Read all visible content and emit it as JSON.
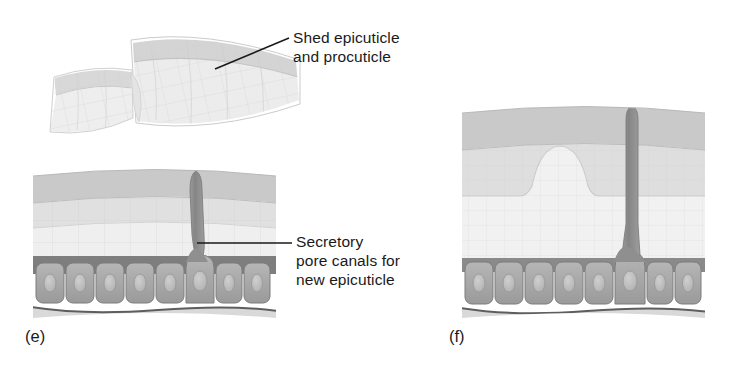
{
  "figure": {
    "background_color": "#ffffff",
    "text_color": "#1a1a1a",
    "leader_line_color": "#1a1a1a",
    "callouts": {
      "shed": {
        "line1": "Shed epicuticle",
        "line2": "and procuticle"
      },
      "secretory": {
        "line1": "Secretory",
        "line2": "pore canals for",
        "line3": "new epicuticle"
      }
    },
    "panels": [
      {
        "id": "e",
        "label": "(e)",
        "description": "Cuticle cross-section with shed epicuticle and procuticle fragments above and a secretory pore canal",
        "cell_count": 8,
        "secretory_cell_index": 6
      },
      {
        "id": "f",
        "label": "(f)",
        "description": "Cuticle cross-section with new epicuticle dome and elongated secretory pore canal",
        "cell_count": 8,
        "secretory_cell_index": 6
      }
    ],
    "colors": {
      "outer_cuticle_band": "#c9c9c9",
      "procuticle_light": "#ededed",
      "procuticle_mid": "#e2e2e2",
      "epidermis_dark_band": "#7e7e7e",
      "epidermal_cell": "#a8a8a8",
      "cell_nucleus": "#bdbdbd",
      "pore_canal": "#8d8d8d",
      "shed_fragment_top": "#d6d6d6",
      "shed_fragment_bottom": "#eaeaea",
      "basement_membrane": "#5e5e5e"
    },
    "shed_fragments": [
      {
        "name": "shed-fragment-left",
        "layers": 2
      },
      {
        "name": "shed-fragment-right",
        "layers": 2
      }
    ]
  }
}
